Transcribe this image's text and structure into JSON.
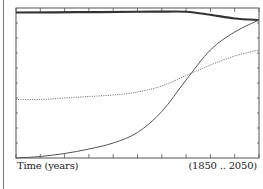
{
  "chart_data": {
    "type": "line",
    "title": "",
    "xlabel": "Time (years)",
    "range_label": "(1850 .. 2050)",
    "ylabel": "",
    "xlim": [
      1850,
      2050
    ],
    "ylim": [
      0,
      1
    ],
    "x_ticks": [
      1850,
      1870,
      1890,
      1910,
      1930,
      1950,
      1970,
      1990,
      2010,
      2030,
      2050
    ],
    "y_tick_count": 10,
    "grid": false,
    "legend": "none",
    "colors": {
      "frame": "#555555",
      "thick": "#333333",
      "solid": "#555555",
      "dotted": "#666666"
    },
    "series": [
      {
        "name": "thick-line",
        "style": "thick",
        "x": [
          1850,
          1900,
          1950,
          1970,
          1990,
          2010,
          2030,
          2050
        ],
        "values": [
          0.97,
          0.972,
          0.975,
          0.976,
          0.975,
          0.955,
          0.93,
          0.92
        ]
      },
      {
        "name": "solid-curve",
        "style": "solid",
        "x": [
          1850,
          1870,
          1890,
          1910,
          1930,
          1950,
          1970,
          1990,
          2010,
          2030,
          2050
        ],
        "values": [
          0.0,
          0.01,
          0.03,
          0.06,
          0.1,
          0.17,
          0.31,
          0.52,
          0.72,
          0.84,
          0.92
        ]
      },
      {
        "name": "dotted-curve",
        "style": "dotted",
        "x": [
          1850,
          1870,
          1890,
          1910,
          1930,
          1950,
          1970,
          1990,
          2010,
          2030,
          2050
        ],
        "values": [
          0.39,
          0.39,
          0.4,
          0.41,
          0.42,
          0.44,
          0.48,
          0.55,
          0.62,
          0.68,
          0.72
        ]
      }
    ]
  }
}
